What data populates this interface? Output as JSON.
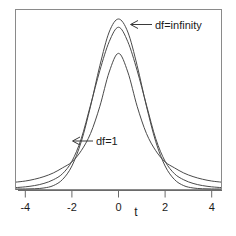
{
  "chart_data": {
    "type": "line",
    "title": "",
    "subtitle": "",
    "xlabel": "t",
    "ylabel": "",
    "xlim": [
      -4.4,
      4.4
    ],
    "ylim": [
      0,
      0.42
    ],
    "grid": false,
    "legend_position": "none",
    "xticks": [
      -4,
      -2,
      0,
      2,
      4
    ],
    "xtick_labels": [
      "-4",
      "-2",
      "0",
      "2",
      "4"
    ],
    "yticks": [],
    "ytick_labels": [],
    "annotations": [
      {
        "id": "annot-df-infinity",
        "text": "df=infinity",
        "points_to_x": 0.25,
        "arrow_direction": "left",
        "target_series": "df=infinity"
      },
      {
        "id": "annot-df-1",
        "text": "df=1",
        "points_to_x": -1.75,
        "arrow_direction": "left",
        "target_series": "df=1"
      }
    ],
    "x": [
      -4.4,
      -4.0,
      -3.6,
      -3.2,
      -2.8,
      -2.4,
      -2.0,
      -1.6,
      -1.2,
      -0.8,
      -0.4,
      0.0,
      0.4,
      0.8,
      1.2,
      1.6,
      2.0,
      2.4,
      2.8,
      3.2,
      3.6,
      4.0,
      4.4
    ],
    "series": [
      {
        "name": "df=infinity",
        "label": "df=infinity",
        "description": "standard normal density, tallest peak and thinnest tails",
        "peak_value": 0.399,
        "values": [
          0.0001,
          0.0001,
          0.0006,
          0.0024,
          0.0079,
          0.0224,
          0.054,
          0.1109,
          0.1942,
          0.2897,
          0.3683,
          0.3989,
          0.3683,
          0.2897,
          0.1942,
          0.1109,
          0.054,
          0.0224,
          0.0079,
          0.0024,
          0.0006,
          0.0001,
          0.0001
        ]
      },
      {
        "name": "df=5",
        "label": "df=5",
        "description": "Student t density with 5 degrees of freedom, intermediate peak",
        "peak_value": 0.3796,
        "values": [
          0.0033,
          0.0051,
          0.0081,
          0.0131,
          0.0216,
          0.036,
          0.0651,
          0.1178,
          0.197,
          0.2781,
          0.3456,
          0.3796,
          0.3456,
          0.2781,
          0.197,
          0.1178,
          0.0651,
          0.036,
          0.0216,
          0.0131,
          0.0081,
          0.0051,
          0.0033
        ]
      },
      {
        "name": "df=1",
        "label": "df=1",
        "description": "Cauchy density (t with 1 df), lowest peak and fattest tails",
        "peak_value": 0.3183,
        "values": [
          0.0162,
          0.0187,
          0.023,
          0.0291,
          0.0376,
          0.0497,
          0.0637,
          0.0898,
          0.1303,
          0.1941,
          0.2744,
          0.3183,
          0.2744,
          0.1941,
          0.1303,
          0.0898,
          0.0637,
          0.0497,
          0.0376,
          0.0291,
          0.023,
          0.0187,
          0.0162
        ]
      }
    ]
  },
  "axis": {
    "x_title": "t",
    "tick_labels": [
      "-4",
      "-2",
      "0",
      "2",
      "4"
    ]
  },
  "labels": {
    "df_infinity": "df=infinity",
    "df_one": "df=1"
  },
  "colors": {
    "background": "#ffffff",
    "curve": "#4a4a4a",
    "frame": "#8a8a8a",
    "axis": "#6a6a6a",
    "text": "#1a1a1a"
  }
}
